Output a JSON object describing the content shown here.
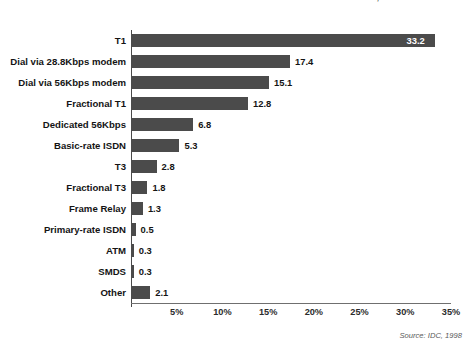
{
  "chart_data": {
    "type": "bar",
    "orientation": "horizontal",
    "title": "FIGURE 20: REPRESENTATIVE INTERNET ACCESS TECHNOLOGIES FOR U.S. ENTERPRISES, 1998",
    "xlabel": "",
    "ylabel": "",
    "xlim": [
      0,
      35
    ],
    "grid": true,
    "legend": null,
    "source": "Source: IDC, 1998",
    "tick_labels": [
      "5%",
      "10%",
      "15%",
      "20%",
      "25%",
      "30%",
      "35%"
    ],
    "tick_values": [
      5,
      10,
      15,
      20,
      25,
      30,
      35
    ],
    "categories": [
      "T1",
      "Dial via 28.8Kbps modem",
      "Dial via 56Kbps modem",
      "Fractional T1",
      "Dedicated 56Kbps",
      "Basic-rate ISDN",
      "T3",
      "Fractional T3",
      "Frame Relay",
      "Primary-rate ISDN",
      "ATM",
      "SMDS",
      "Other"
    ],
    "values": [
      33.2,
      17.4,
      15.1,
      12.8,
      6.8,
      5.3,
      2.8,
      1.8,
      1.3,
      0.5,
      0.3,
      0.3,
      2.1
    ],
    "value_labels": [
      "33.2",
      "17.4",
      "15.1",
      "12.8",
      "6.8",
      "5.3",
      "2.8",
      "1.8",
      "1.3",
      "0.5",
      "0.3",
      "0.3",
      "2.1"
    ],
    "bar_color": "#4b4b4b",
    "label_inside_bar": [
      true,
      false,
      false,
      false,
      false,
      false,
      false,
      false,
      false,
      false,
      false,
      false,
      false
    ]
  }
}
